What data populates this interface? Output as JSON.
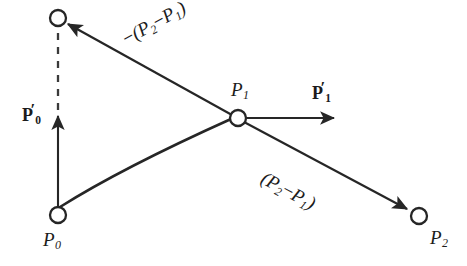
{
  "figure": {
    "background_color": "#ffffff",
    "stroke_color": "#262626",
    "node_fill_color": "#ffffff",
    "nodes": [
      {
        "name": "control-point-top",
        "label": "",
        "cx": 58,
        "cy": 18,
        "r": 8
      },
      {
        "name": "point-p0",
        "label": "P",
        "sub": "0",
        "cx": 58,
        "cy": 215,
        "r": 8
      },
      {
        "name": "point-p1",
        "label": "P",
        "sub": "1",
        "cx": 238,
        "cy": 118,
        "r": 8
      },
      {
        "name": "point-p2",
        "label": "P",
        "sub": "2",
        "cx": 419,
        "cy": 216,
        "r": 8
      }
    ],
    "labels": {
      "p0_point": {
        "text": "P",
        "sub": "0"
      },
      "p1_point": {
        "text": "P",
        "sub": "1"
      },
      "p2_point": {
        "text": "P",
        "sub": "2"
      },
      "p0_tangent": {
        "base": "P",
        "sub": "0",
        "prime": "′"
      },
      "p1_tangent": {
        "base": "P",
        "sub": "1",
        "prime": "′"
      },
      "upper_expression": {
        "minus": "−",
        "open": "(",
        "p_a": "P",
        "sub_a": "2",
        "dash": "−",
        "p_b": "P",
        "sub_b": "1",
        "close": ")"
      },
      "lower_expression": {
        "open": "(",
        "p_a": "P",
        "sub_a": "2",
        "dash": "−",
        "p_b": "P",
        "sub_b": "1",
        "close": ")"
      }
    },
    "geometry": {
      "curve": {
        "name": "bezier-curve",
        "from": [
          58,
          215
        ],
        "to": [
          238,
          118
        ],
        "control": [
          118,
          168
        ]
      },
      "solid_vertical_arrow": {
        "name": "p0-tangent-arrow",
        "x": 58,
        "y_start": 215,
        "y_end": 113
      },
      "dashed_vertical_line": {
        "name": "p0-tangent-extension",
        "x": 58,
        "y_start": 110,
        "y_end": 27
      },
      "upper_arrow": {
        "name": "negative-delta-arrow",
        "from": [
          238,
          118
        ],
        "to": [
          68,
          24
        ]
      },
      "horizontal_arrow": {
        "name": "p1-tangent-arrow",
        "from": [
          248,
          118
        ],
        "to": [
          337,
          118
        ]
      },
      "lower_arrow": {
        "name": "delta-arrow",
        "from": [
          246,
          122
        ],
        "to": [
          409,
          210
        ]
      }
    }
  }
}
